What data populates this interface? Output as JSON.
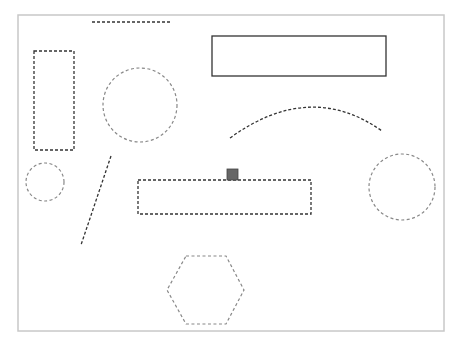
{
  "canvas": {
    "frame": {
      "x": 18,
      "y": 15,
      "w": 426,
      "h": 316,
      "stroke": "#c8c8c8"
    },
    "colors": {
      "dark": "#333333",
      "gray": "#888888",
      "handle": "#666666"
    }
  },
  "shapes": [
    {
      "id": "top-dashed-line",
      "type": "line",
      "x1": 92,
      "y1": 22,
      "x2": 170,
      "y2": 22,
      "style": "dark-dashed"
    },
    {
      "id": "left-tall-rect",
      "type": "rect",
      "x": 34,
      "y": 51,
      "w": 40,
      "h": 99,
      "style": "dark-dashed"
    },
    {
      "id": "top-right-rect",
      "type": "rect",
      "x": 212,
      "y": 36,
      "w": 174,
      "h": 40,
      "style": "solid"
    },
    {
      "id": "large-circle",
      "type": "circle",
      "cx": 140,
      "cy": 105,
      "r": 37,
      "style": "gray-dashed"
    },
    {
      "id": "arc-curve",
      "type": "path",
      "d": "M 230 138 Q 310 80 382 131",
      "style": "dark-dashed"
    },
    {
      "id": "small-circle",
      "type": "circle",
      "cx": 45,
      "cy": 182,
      "r": 19,
      "style": "gray-dashed"
    },
    {
      "id": "diagonal-line",
      "type": "line",
      "x1": 111,
      "y1": 156,
      "x2": 81,
      "y2": 245,
      "style": "dark-dashed"
    },
    {
      "id": "middle-wide-rect",
      "type": "rect",
      "x": 138,
      "y": 180,
      "w": 173,
      "h": 34,
      "style": "dark-dashed"
    },
    {
      "id": "right-circle",
      "type": "circle",
      "cx": 402,
      "cy": 187,
      "r": 33,
      "style": "gray-dashed"
    },
    {
      "id": "hexagon",
      "type": "polygon",
      "points": "186,256 226,256 244,290 226,324 186,324 167,290",
      "style": "gray-dashed"
    }
  ],
  "selection_handle": {
    "x": 227,
    "y": 169,
    "w": 11,
    "h": 11
  }
}
